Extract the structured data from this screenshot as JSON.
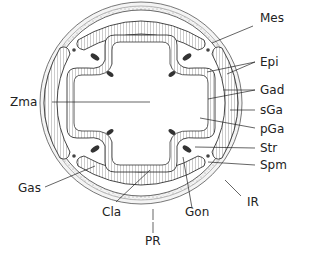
{
  "diagram": {
    "type": "anatomical cross-section",
    "labels": {
      "mes": "Mes",
      "epi": "Epi",
      "gad": "Gad",
      "sga": "sGa",
      "pga": "pGa",
      "str": "Str",
      "spm": "Spm",
      "ir": "IR",
      "zma": "Zma",
      "gas": "Gas",
      "cla": "Cla",
      "gon": "Gon",
      "pr": "PR"
    }
  }
}
